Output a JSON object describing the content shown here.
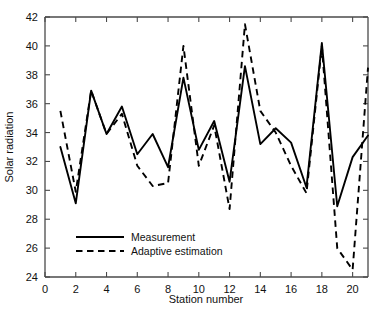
{
  "chart_data": {
    "type": "line",
    "title": "",
    "xlabel": "Station number",
    "ylabel": "Solar radiation",
    "xlim": [
      0,
      21
    ],
    "ylim": [
      24,
      42
    ],
    "xticks": [
      0,
      2,
      4,
      6,
      8,
      10,
      12,
      14,
      16,
      18,
      20
    ],
    "yticks": [
      24,
      26,
      28,
      30,
      32,
      34,
      36,
      38,
      40,
      42
    ],
    "grid": false,
    "legend_position": "lower-left-inside",
    "x": [
      1,
      2,
      3,
      4,
      5,
      6,
      7,
      8,
      9,
      10,
      11,
      12,
      13,
      14,
      15,
      16,
      17,
      18,
      19,
      20,
      21
    ],
    "series": [
      {
        "name": "Measurement",
        "style": "solid",
        "color": "#000000",
        "values": [
          33.0,
          29.1,
          36.9,
          33.9,
          35.8,
          32.5,
          33.9,
          31.6,
          37.8,
          32.8,
          34.8,
          30.6,
          38.6,
          33.2,
          34.3,
          33.3,
          30.2,
          40.2,
          28.9,
          32.3,
          33.8
        ]
      },
      {
        "name": "Adaptive estimation",
        "style": "dashed",
        "color": "#000000",
        "values": [
          35.5,
          29.9,
          36.9,
          33.9,
          35.3,
          31.7,
          30.3,
          30.5,
          40.0,
          31.7,
          34.5,
          28.7,
          41.5,
          35.5,
          34.0,
          31.7,
          29.8,
          40.0,
          26.0,
          24.5,
          38.5
        ]
      }
    ]
  },
  "axes": {
    "x_title": "Station number",
    "y_title": "Solar radiation",
    "x_tick_labels": [
      "0",
      "2",
      "4",
      "6",
      "8",
      "10",
      "12",
      "14",
      "16",
      "18",
      "20"
    ],
    "y_tick_labels": [
      "24",
      "26",
      "28",
      "30",
      "32",
      "34",
      "36",
      "38",
      "40",
      "42"
    ]
  },
  "legend": {
    "entries": [
      {
        "label": "Measurement",
        "style": "solid"
      },
      {
        "label": "Adaptive estimation",
        "style": "dashed"
      }
    ]
  },
  "colors": {
    "series": "#000000",
    "axis": "#4a4a4a",
    "background": "#ffffff"
  }
}
